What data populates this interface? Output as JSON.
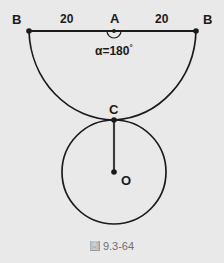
{
  "figure": {
    "caption_glyph": "圖",
    "caption_text": "9.3-64",
    "background_color": "#e9e9e9",
    "stroke_color": "#1b1b1b"
  },
  "labels": {
    "point_b_left": "B",
    "point_b_right": "B",
    "point_a": "A",
    "point_c": "C",
    "point_o": "O",
    "segment_left_length": "20",
    "segment_right_length": "20",
    "angle_alpha": "α=180",
    "angle_degree_symbol": "°"
  },
  "geometry": {
    "baseline": {
      "x1": 29,
      "y1": 31,
      "x2": 196,
      "y2": 31
    },
    "point_a": {
      "x": 114,
      "y": 31
    },
    "point_b_left": {
      "x": 29,
      "y": 31
    },
    "point_b_right": {
      "x": 196,
      "y": 31
    },
    "point_c": {
      "x": 114,
      "y": 120
    },
    "point_o": {
      "x": 114,
      "y": 172
    },
    "arc": {
      "start_x": 29,
      "start_y": 31,
      "end_x": 196,
      "end_y": 31,
      "radius_x": 86,
      "radius_y": 92,
      "sweep": 1,
      "description": "large-arc-from-B-through-C-to-B"
    },
    "circle": {
      "center_x": 114,
      "center_y": 172,
      "radius": 52
    },
    "radius_segment": {
      "x1": 114,
      "y1": 120,
      "x2": 114,
      "y2": 172
    },
    "angle_marker": {
      "center_x": 114,
      "center_y": 31,
      "radius": 7,
      "description": "semicircular-arc-below-A-spanning-180-degrees"
    },
    "dot_radius": 2.6
  }
}
